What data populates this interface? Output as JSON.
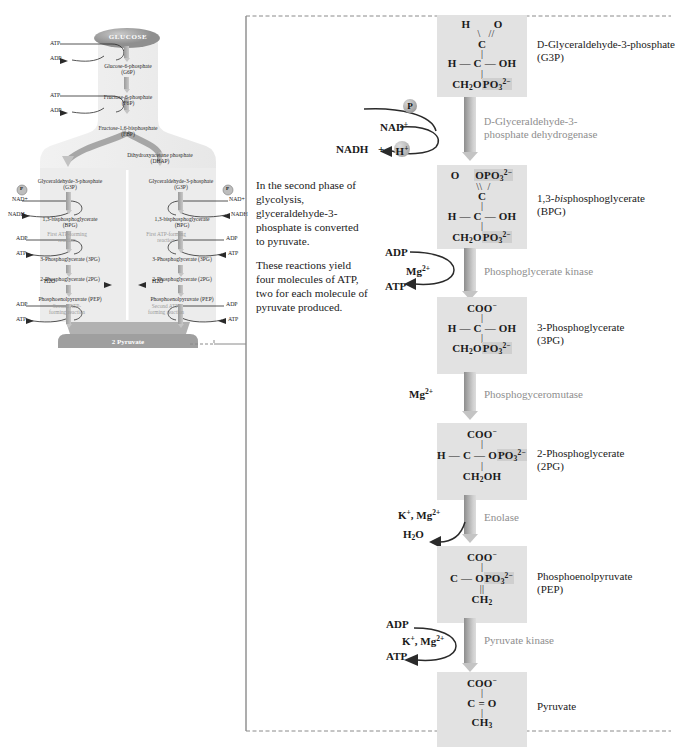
{
  "caption": {
    "paragraph1": "In the second phase of glycolysis, glyceraldehyde-3-phosphate is converted to pyruvate.",
    "paragraph2": "These reactions yield four molecules of ATP, two for each molecule of pyruvate produced."
  },
  "colors": {
    "structure_box": "#e2e2e2",
    "phosphate_highlight": "#cfcfcf",
    "enzyme_text": "#8e8e8e",
    "arrow_dark": "#8d8d8d",
    "arrow_light": "#dcdcdc",
    "bracket": "#8a8a8a",
    "text": "#1a1a1a"
  },
  "pathway": {
    "steps": [
      {
        "id": "g3p",
        "structure_lines": [
          "H",
          "C",
          "OH",
          "CH2OPO3 2-"
        ],
        "name": "D-Glyceraldehyde-3-phosphate",
        "abbrev": "(G3P)"
      },
      {
        "id": "bpg",
        "structure_lines": [
          "O",
          "C",
          "OPO3 2-",
          "H",
          "OH",
          "CH2OPO3 2-"
        ],
        "name": "1,3-bisphosphoglycerate",
        "name_italic": "bis",
        "abbrev": "(BPG)"
      },
      {
        "id": "3pg",
        "structure_lines": [
          "COO-",
          "H",
          "C",
          "OH",
          "CH2OPO3 2-"
        ],
        "name": "3-Phosphoglycerate",
        "abbrev": "(3PG)"
      },
      {
        "id": "2pg",
        "structure_lines": [
          "COO-",
          "H",
          "C",
          "OPO3 2-",
          "CH2OH"
        ],
        "name": "2-Phosphoglycerate",
        "abbrev": "(2PG)"
      },
      {
        "id": "pep",
        "structure_lines": [
          "COO-",
          "C",
          "OPO3 2-",
          "CH2"
        ],
        "name": "Phosphoenolpyruvate",
        "abbrev": "(PEP)"
      },
      {
        "id": "pyruvate",
        "structure_lines": [
          "COO-",
          "C",
          "O",
          "CH3"
        ],
        "name": "Pyruvate",
        "abbrev": ""
      }
    ],
    "enzymes": [
      {
        "id": "gapdh",
        "line1": "D-Glyceraldehyde-3-",
        "line2": "phosphate dehydrogenase"
      },
      {
        "id": "pgk",
        "line1": "Phosphoglycerate kinase",
        "line2": ""
      },
      {
        "id": "pgm",
        "line1": "Phosphogyceromutase",
        "line2": ""
      },
      {
        "id": "enolase",
        "line1": "Enolase",
        "line2": ""
      },
      {
        "id": "pk",
        "line1": "Pyruvate kinase",
        "line2": ""
      }
    ],
    "cofactors": {
      "p_circle": "P",
      "nad_plus": "NAD+",
      "nadh": "NADH",
      "plus_sign": "+",
      "h_plus": "H+",
      "adp_1": "ADP",
      "mg_1": "Mg2+",
      "atp_1": "ATP",
      "mg_2": "Mg2+",
      "k_mg_1": "K+, Mg2+",
      "water": "H2O",
      "adp_2": "ADP",
      "k_mg_2": "K+, Mg2+",
      "atp_2": "ATP"
    }
  },
  "overview": {
    "title": "GLUCOSE",
    "nodes": [
      {
        "id": "g6p",
        "line1": "Glucose-6-phosphate",
        "line2": "(G6P)"
      },
      {
        "id": "f6p",
        "line1": "Fructose-6-phosphate",
        "line2": "(F6P)"
      },
      {
        "id": "fbp",
        "line1": "Fructose-1,6-bisphosphate",
        "line2": "(FBP)"
      },
      {
        "id": "dhap",
        "line1": "Dihydroxyacetone phosphate",
        "line2": "(DHAP)"
      },
      {
        "id": "g3p_left",
        "line1": "Glyceraldehyde-3-phosphate",
        "line2": "(G3P)"
      },
      {
        "id": "g3p_right",
        "line1": "Glyceraldehyde-3-phosphate",
        "line2": "(G3P)"
      },
      {
        "id": "bpg_left",
        "line1": "1,3-bisphosphoglycerate",
        "line2": "(BPG)"
      },
      {
        "id": "bpg_right",
        "line1": "1,3-bisphosphoglycerate",
        "line2": "(BPG)"
      },
      {
        "id": "pg3_left",
        "line1": "3-Phosphoglycerate (3PG)",
        "line2": ""
      },
      {
        "id": "pg3_right",
        "line1": "3-Phosphoglycerate (3PG)",
        "line2": ""
      },
      {
        "id": "pg2_left",
        "line1": "2-Phosphoglycerate (2PG)",
        "line2": ""
      },
      {
        "id": "pg2_right",
        "line1": "2-Phosphoglycerate (2PG)",
        "line2": ""
      },
      {
        "id": "pep_left",
        "line1": "Phosphoenolpyruvate (PEP)",
        "line2": ""
      },
      {
        "id": "pep_right",
        "line1": "Phosphoenolpyruvate (PEP)",
        "line2": ""
      },
      {
        "id": "pyruvate",
        "line1": "2 Pyruvate",
        "line2": ""
      }
    ],
    "side_labels": {
      "atp_1": "ATP",
      "adp_1": "ADP",
      "atp_2": "ATP",
      "adp_2": "ADP",
      "p_left": "P",
      "p_right": "P",
      "nad_left": "NAD+",
      "nad_right": "NAD+",
      "nadh_left": "NADH",
      "nadh_right": "NADH",
      "adp_l1": "ADP",
      "atp_l1": "ATP",
      "adp_r1": "ADP",
      "atp_r1": "ATP",
      "h2o_left": "H2O",
      "h2o_right": "H2O",
      "adp_l2": "ADP",
      "atp_l2": "ATP",
      "adp_r2": "ADP",
      "atp_r2": "ATP"
    },
    "enzyme_notes": {
      "first_left": "First ATP-forming reaction",
      "first_right": "First ATP-forming reaction",
      "second_left": "Second ATP-forming reaction",
      "second_right": "Second ATP-forming reaction"
    }
  }
}
